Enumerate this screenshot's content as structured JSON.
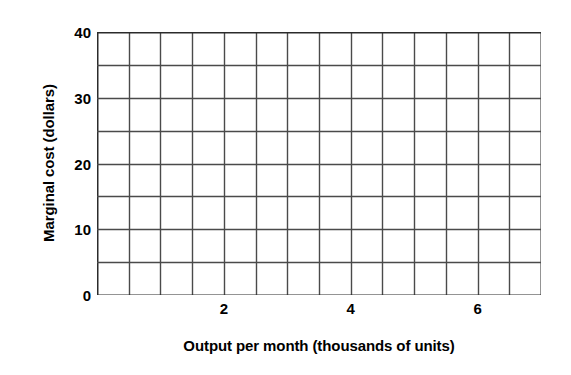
{
  "chart_data": {
    "type": "line",
    "title": "",
    "subtitle": "",
    "xlabel": "Output per month (thousands of units)",
    "ylabel": "Marginal cost (dollars)",
    "xlim": [
      0,
      7
    ],
    "ylim": [
      0,
      40
    ],
    "x_tick_labels": [
      "2",
      "4",
      "6"
    ],
    "x_tick_values": [
      2,
      4,
      6
    ],
    "y_tick_labels": [
      "0",
      "10",
      "20",
      "30",
      "40"
    ],
    "y_tick_values": [
      0,
      10,
      20,
      30,
      40
    ],
    "x_gridline_step": 0.5,
    "y_gridline_step": 5,
    "x_gridline_count": 15,
    "y_gridline_count": 9,
    "grid": true,
    "legend": null,
    "legend_position": "none",
    "series": [],
    "annotations": [],
    "note": "Empty grid — no data series plotted",
    "colors": {
      "background": "#ffffff",
      "grid_line": "#4a4a4a",
      "axis_line": "#2b2b2b",
      "text": "#000000"
    }
  }
}
